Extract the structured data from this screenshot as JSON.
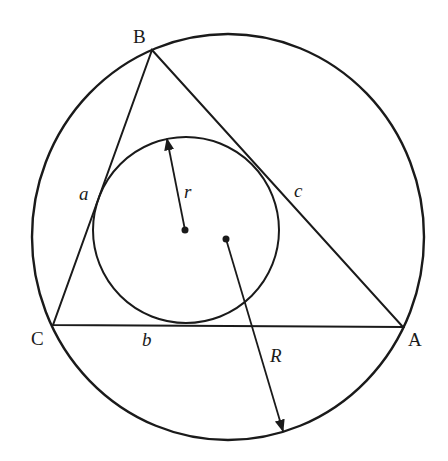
{
  "diagram": {
    "vertices": [
      {
        "name": "A",
        "x": 403,
        "y": 327
      },
      {
        "name": "B",
        "x": 152,
        "y": 50
      },
      {
        "name": "C",
        "x": 53,
        "y": 325
      }
    ],
    "sides": [
      {
        "name": "a",
        "from": "B",
        "to": "C"
      },
      {
        "name": "b",
        "from": "C",
        "to": "A"
      },
      {
        "name": "c",
        "from": "A",
        "to": "B"
      }
    ],
    "incircle": {
      "cx": 186,
      "cy": 230,
      "r": 93,
      "radius_label": "r"
    },
    "circumcircle": {
      "cx": 228,
      "cy": 237,
      "rx": 196,
      "ry": 203,
      "radius_label": "R"
    },
    "stroke_color": "#1a1a1a"
  },
  "labels": {
    "A": "A",
    "B": "B",
    "C": "C",
    "a": "a",
    "b": "b",
    "c": "c",
    "r": "r",
    "R": "R"
  }
}
